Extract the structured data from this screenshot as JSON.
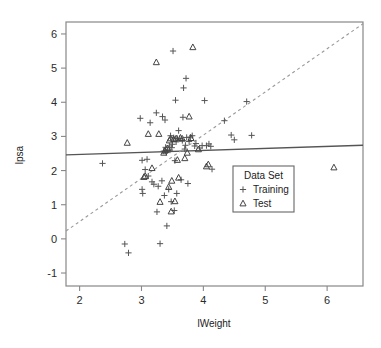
{
  "chart_data": {
    "type": "scatter",
    "title": "",
    "xlabel": "lWeight",
    "ylabel": "lpsa",
    "xlim": [
      1.78,
      6.58
    ],
    "ylim": [
      -1.38,
      6.35
    ],
    "xticks": [
      "2",
      "3",
      "4",
      "5",
      "6"
    ],
    "xtick_values": [
      2,
      3,
      4,
      5,
      6
    ],
    "yticks": [
      "-1",
      "0",
      "1",
      "2",
      "3",
      "4",
      "5",
      "6"
    ],
    "ytick_values": [
      -1,
      0,
      1,
      2,
      3,
      4,
      5,
      6
    ],
    "grid": false,
    "legend": {
      "title": "Data Set",
      "position": "center-right",
      "entries": [
        {
          "label": "Training",
          "marker": "plus"
        },
        {
          "label": "Test",
          "marker": "triangle"
        }
      ]
    },
    "lines": [
      {
        "name": "regression-fit",
        "style": "solid",
        "color": "#555555",
        "points": [
          [
            1.78,
            2.46
          ],
          [
            6.58,
            2.74
          ]
        ]
      },
      {
        "name": "identity-reference",
        "style": "dashed",
        "color": "#999999",
        "points": [
          [
            1.78,
            0.23
          ],
          [
            6.58,
            6.3
          ]
        ]
      }
    ],
    "series": [
      {
        "name": "Training",
        "marker": "plus",
        "color": "#555555",
        "points": [
          [
            2.37,
            2.21
          ],
          [
            2.73,
            -0.15
          ],
          [
            2.79,
            -0.41
          ],
          [
            2.98,
            3.53
          ],
          [
            3.01,
            2.3
          ],
          [
            3.01,
            1.45
          ],
          [
            3.02,
            1.33
          ],
          [
            3.06,
            2.03
          ],
          [
            3.09,
            2.33
          ],
          [
            3.11,
            1.84
          ],
          [
            3.14,
            3.4
          ],
          [
            3.17,
            1.67
          ],
          [
            3.2,
            1.6
          ],
          [
            3.24,
            3.69
          ],
          [
            3.25,
            0.79
          ],
          [
            3.27,
            1.54
          ],
          [
            3.3,
            -0.14
          ],
          [
            3.33,
            1.7
          ],
          [
            3.34,
            3.58
          ],
          [
            3.36,
            2.57
          ],
          [
            3.37,
            1.27
          ],
          [
            3.38,
            3.48
          ],
          [
            3.39,
            2.68
          ],
          [
            3.4,
            2.53
          ],
          [
            3.41,
            0.38
          ],
          [
            3.42,
            2.6
          ],
          [
            3.44,
            1.45
          ],
          [
            3.45,
            2.72
          ],
          [
            3.46,
            2.6
          ],
          [
            3.47,
            3.02
          ],
          [
            3.48,
            1.09
          ],
          [
            3.49,
            2.67
          ],
          [
            3.5,
            2.77
          ],
          [
            3.51,
            5.5
          ],
          [
            3.52,
            2.96
          ],
          [
            3.53,
            0.83
          ],
          [
            3.54,
            2.29
          ],
          [
            3.55,
            4.06
          ],
          [
            3.56,
            2.84
          ],
          [
            3.57,
            1.33
          ],
          [
            3.58,
            2.94
          ],
          [
            3.6,
            3.17
          ],
          [
            3.62,
            2.94
          ],
          [
            3.64,
            1.73
          ],
          [
            3.66,
            2.88
          ],
          [
            3.67,
            3.56
          ],
          [
            3.68,
            4.42
          ],
          [
            3.7,
            2.63
          ],
          [
            3.71,
            2.74
          ],
          [
            3.72,
            4.7
          ],
          [
            3.73,
            2.97
          ],
          [
            3.75,
            1.62
          ],
          [
            3.77,
            2.85
          ],
          [
            3.79,
            2.98
          ],
          [
            3.82,
            3.02
          ],
          [
            3.86,
            2.72
          ],
          [
            3.88,
            2.79
          ],
          [
            3.94,
            2.66
          ],
          [
            3.98,
            2.73
          ],
          [
            4.02,
            4.05
          ],
          [
            4.05,
            2.73
          ],
          [
            4.09,
            2.78
          ],
          [
            4.12,
            2.71
          ],
          [
            4.14,
            2.04
          ],
          [
            4.34,
            3.46
          ],
          [
            4.45,
            3.04
          ],
          [
            4.5,
            2.9
          ],
          [
            4.7,
            4.02
          ],
          [
            4.78,
            3.03
          ]
        ]
      },
      {
        "name": "Test",
        "marker": "triangle",
        "color": "#444444",
        "points": [
          [
            2.77,
            2.81
          ],
          [
            3.04,
            1.81
          ],
          [
            3.06,
            1.84
          ],
          [
            3.11,
            3.07
          ],
          [
            3.17,
            2.07
          ],
          [
            3.24,
            5.17
          ],
          [
            3.28,
            3.07
          ],
          [
            3.3,
            1.08
          ],
          [
            3.36,
            2.52
          ],
          [
            3.38,
            2.58
          ],
          [
            3.42,
            2.65
          ],
          [
            3.44,
            1.52
          ],
          [
            3.45,
            2.88
          ],
          [
            3.47,
            2.94
          ],
          [
            3.48,
            0.8
          ],
          [
            3.49,
            1.7
          ],
          [
            3.52,
            2.92
          ],
          [
            3.54,
            1.1
          ],
          [
            3.56,
            2.94
          ],
          [
            3.58,
            2.31
          ],
          [
            3.6,
            1.79
          ],
          [
            3.63,
            2.96
          ],
          [
            3.66,
            2.93
          ],
          [
            3.7,
            2.36
          ],
          [
            3.74,
            2.52
          ],
          [
            3.77,
            3.58
          ],
          [
            3.8,
            2.95
          ],
          [
            3.83,
            5.61
          ],
          [
            3.92,
            2.62
          ],
          [
            4.05,
            2.12
          ],
          [
            4.08,
            2.18
          ],
          [
            6.11,
            2.09
          ]
        ]
      }
    ]
  },
  "axes": {
    "x_title": "lWeight",
    "y_title": "lpsa"
  }
}
